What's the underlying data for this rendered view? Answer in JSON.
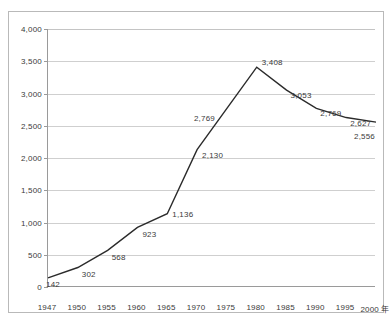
{
  "chart_data": {
    "type": "line",
    "title": "",
    "xlabel": "年",
    "ylabel": "",
    "ylim": [
      0,
      4000
    ],
    "ytick_step": 500,
    "grid": true,
    "legend": "none",
    "axis_unit_suffix": "年",
    "categories": [
      "1947",
      "1950",
      "1955",
      "1960",
      "1965",
      "1970",
      "1975",
      "1980",
      "1985",
      "1990",
      "1995",
      "2000"
    ],
    "values": [
      142,
      302,
      568,
      923,
      1136,
      2130,
      2769,
      3408,
      3053,
      2769,
      2627,
      2556
    ],
    "point_labels": [
      "142",
      "302",
      "568",
      "923",
      "1,136",
      "2,130",
      "2,769",
      "3,408",
      "3,053",
      "2,769",
      "2,627",
      "2,556"
    ],
    "ytick_labels": [
      "4,000",
      "3,500",
      "3,000",
      "2,500",
      "2,000",
      "1,500",
      "1,000",
      "500",
      "0"
    ],
    "ytick_values": [
      4000,
      3500,
      3000,
      2500,
      2000,
      1500,
      1000,
      500,
      0
    ],
    "xtick_labels": [
      "1947",
      "1950",
      "1955",
      "1960",
      "1965",
      "1970",
      "1975",
      "1980",
      "1985",
      "1990",
      "1995",
      "2000 年"
    ],
    "series": [
      {
        "name": "series-1",
        "color": "#2b2b2b",
        "values": [
          142,
          302,
          568,
          923,
          1136,
          2130,
          2769,
          3408,
          3053,
          2769,
          2627,
          2556
        ]
      }
    ],
    "colors": {
      "line": "#2b2b2b",
      "gridline": "#cfcfcf",
      "axis": "#9a9a9a",
      "border": "#b9b9b9",
      "text": "#3a3a3a",
      "background": "#ffffff"
    },
    "label_offsets": [
      {
        "dx": -2,
        "dy": 10
      },
      {
        "dx": 4,
        "dy": 10
      },
      {
        "dx": 4,
        "dy": 11
      },
      {
        "dx": 5,
        "dy": 11
      },
      {
        "dx": 5,
        "dy": 4
      },
      {
        "dx": 5,
        "dy": 9
      },
      {
        "dx": -33,
        "dy": 14
      },
      {
        "dx": 5,
        "dy": -1
      },
      {
        "dx": 4,
        "dy": 9
      },
      {
        "dx": 4,
        "dy": 9
      },
      {
        "dx": 4,
        "dy": 9
      },
      {
        "dx": -22,
        "dy": 18
      }
    ]
  }
}
